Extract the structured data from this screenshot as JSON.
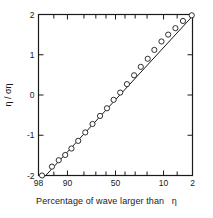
{
  "chart_data": {
    "type": "scatter",
    "title": "",
    "xlabel": "Percentage of wave larger than η",
    "ylabel": "η / ση",
    "xlabel_plain": "Percentage of wave larger than",
    "xlabel_symbol": "η",
    "ylabel_numerator": "η",
    "ylabel_separator": "/",
    "ylabel_denominator": "ση",
    "x_scale": "probability",
    "x_axis_reversed": true,
    "xlim": [
      98,
      2
    ],
    "ylim": [
      -2,
      2
    ],
    "grid": false,
    "legend": null,
    "x_tick_labels": [
      "98",
      "90",
      "50",
      "10",
      "2"
    ],
    "x_tick_values": [
      98,
      90,
      50,
      10,
      2
    ],
    "x_minor_ticks": [
      95,
      80,
      70,
      60,
      40,
      30,
      20,
      5
    ],
    "y_tick_labels": [
      "2",
      "1",
      "0",
      "-1",
      "-2"
    ],
    "y_tick_values": [
      2,
      1,
      0,
      -1,
      -2
    ],
    "marker": "open-circle",
    "line_fit": "straight",
    "series": [
      {
        "name": "wave height distribution",
        "x": [
          97.5,
          95.5,
          93.5,
          91.0,
          88.0,
          84.0,
          79.0,
          73.0,
          66.0,
          59.0,
          52.0,
          45.0,
          38.0,
          31.0,
          25.0,
          19.5,
          15.0,
          11.0,
          8.0,
          5.5,
          3.6,
          2.1
        ],
        "y": [
          -2.0,
          -1.78,
          -1.62,
          -1.49,
          -1.33,
          -1.14,
          -0.93,
          -0.72,
          -0.52,
          -0.33,
          -0.12,
          0.06,
          0.27,
          0.49,
          0.7,
          0.9,
          1.12,
          1.33,
          1.5,
          1.66,
          1.84,
          1.98
        ]
      }
    ],
    "fit_line_endpoints": {
      "x": [
        97.0,
        2.0
      ],
      "y": [
        -2.02,
        1.96
      ]
    }
  },
  "figure": {
    "colors": {
      "axis": "#1a1a1a",
      "marker_stroke": "#1a1a1a",
      "marker_fill": "#ffffff",
      "line": "#1a1a1a",
      "background": "#ffffff"
    }
  }
}
